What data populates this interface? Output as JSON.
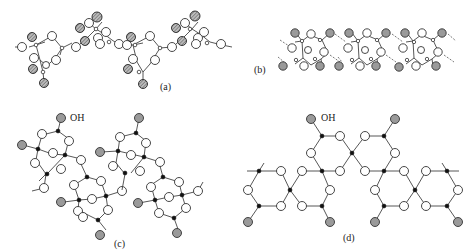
{
  "figure": {
    "panels": [
      {
        "id": "a",
        "label": "(a)",
        "label_pos": [
          168,
          87
        ]
      },
      {
        "id": "b",
        "label": "(b)",
        "label_pos": [
          250,
          73
        ]
      },
      {
        "id": "c",
        "label": "(c)",
        "label_pos": [
          112,
          244
        ]
      },
      {
        "id": "d",
        "label": "(d)",
        "label_pos": [
          352,
          238
        ]
      }
    ],
    "annotations": [
      {
        "id": "oh-c",
        "text": "OH",
        "pos": [
          70,
          118
        ]
      },
      {
        "id": "oh-d",
        "text": "OH",
        "pos": [
          321,
          118
        ]
      }
    ],
    "legend_semantics": {
      "open_circle": "oxygen",
      "shaded_circle": "hydroxyl / hydrogen",
      "black_dot": "silicon"
    },
    "colors": {
      "background": "#ffffff",
      "bond": "#444444",
      "open_atom": "#ffffff",
      "shaded_atom": "#9a9a9a",
      "center_atom": "#111111"
    }
  }
}
